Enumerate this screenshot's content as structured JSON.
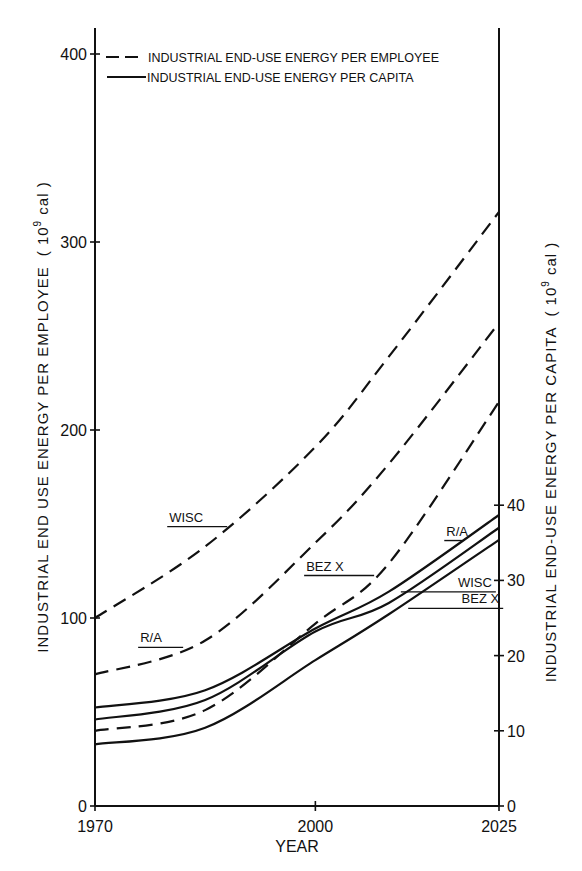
{
  "chart_data": {
    "type": "line",
    "title": "",
    "xlabel": "YEAR",
    "ylabel_left": "INDUSTRIAL END USE ENERGY PER EMPLOYEE",
    "ylabel_left_units_prefix": "( 10",
    "ylabel_left_units_exp": "9",
    "ylabel_left_units_suffix": " cal )",
    "ylabel_right": "INDUSTRIAL END-USE ENERGY PER CAPITA",
    "ylabel_right_units_prefix": "( 10",
    "ylabel_right_units_exp": "9",
    "ylabel_right_units_suffix": " cal )",
    "xlim": [
      1970,
      2025
    ],
    "ylim_left": [
      0,
      400
    ],
    "ylim_right": [
      0,
      40
    ],
    "right_axis_scale_vs_left": 0.25,
    "x_ticks": [
      1970,
      2000,
      2025
    ],
    "x_tick_labels": [
      "1970",
      "2000",
      "2025"
    ],
    "y_left_ticks": [
      0,
      100,
      200,
      300,
      400
    ],
    "y_left_tick_labels": [
      "0",
      "100",
      "200",
      "300",
      "400"
    ],
    "y_right_ticks": [
      0,
      10,
      20,
      30,
      40
    ],
    "y_right_tick_labels": [
      "0",
      "10",
      "20",
      "30",
      "40"
    ],
    "grid": false,
    "legend_position": "top",
    "legend": [
      {
        "label": "INDUSTRIAL END-USE ENERGY PER EMPLOYEE",
        "style": "dashed"
      },
      {
        "label": "INDUSTRIAL END-USE ENERGY PER CAPITA",
        "style": "solid"
      }
    ],
    "x": [
      1970,
      1985,
      2000,
      2010,
      2025
    ],
    "series": [
      {
        "name": "WISC",
        "group": "per employee",
        "axis": "left",
        "style": "dashed",
        "values": [
          100,
          138,
          191,
          239,
          316
        ]
      },
      {
        "name": "R/A",
        "group": "per employee",
        "axis": "left",
        "style": "dashed",
        "values": [
          70,
          88,
          140,
          182,
          257
        ]
      },
      {
        "name": "BEZ X",
        "group": "per employee",
        "axis": "left",
        "style": "dashed",
        "values": [
          40,
          51,
          97,
          129,
          215
        ]
      },
      {
        "name": "R/A",
        "group": "per capita",
        "axis": "right",
        "style": "solid",
        "values": [
          13.1,
          15.4,
          23.6,
          28.5,
          38.7
        ]
      },
      {
        "name": "WISC",
        "group": "per capita",
        "axis": "right",
        "style": "solid",
        "values": [
          11.5,
          14.1,
          23.2,
          27.0,
          37.0
        ]
      },
      {
        "name": "BEZ X",
        "group": "per capita",
        "axis": "right",
        "style": "solid",
        "values": [
          8.2,
          10.4,
          19.4,
          25.5,
          35.4
        ]
      }
    ],
    "annotations": [
      {
        "text": "WISC",
        "series_index": 0,
        "at_year": 1988
      },
      {
        "text": "R/A",
        "series_index": 1,
        "at_year": 1982
      },
      {
        "text": "BEZ X",
        "series_index": 2,
        "at_year": 2008
      },
      {
        "text": "R/A",
        "series_index": 3,
        "at_year": 2020
      },
      {
        "text": "WISC",
        "series_index": 4,
        "at_year": 2013
      },
      {
        "text": "BEZ X",
        "series_index": 5,
        "at_year": 2014
      }
    ]
  }
}
